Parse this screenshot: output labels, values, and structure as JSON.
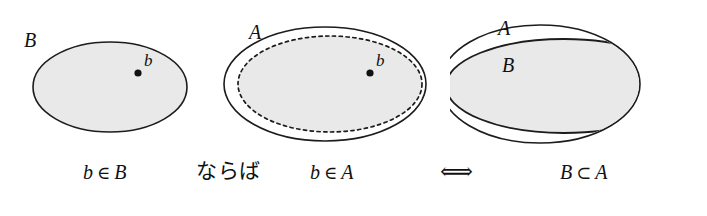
{
  "figure": {
    "background_color": "#ffffff",
    "stroke_color": "#1c1c1c",
    "fill_color": "#e9e9e9"
  },
  "panels": [
    {
      "id": "panel-1",
      "name": "set-b-with-element",
      "set_label": "B",
      "point_label": "b",
      "shapes": [
        {
          "name": "ellipse-b",
          "style": "solid",
          "filled": true
        }
      ],
      "caption": "b ∈ B",
      "caption_left": "b",
      "caption_op": "∈",
      "caption_right": "B"
    },
    {
      "id": "panel-2",
      "name": "set-a-containing-subset-with-element",
      "set_label": "A",
      "point_label": "b",
      "shapes": [
        {
          "name": "ellipse-a-outer",
          "style": "solid",
          "filled": false
        },
        {
          "name": "ellipse-b-inner-dashed",
          "style": "dashed",
          "filled": true
        }
      ],
      "caption": "b ∈ A",
      "caption_left": "b",
      "caption_op": "∈",
      "caption_right": "A"
    },
    {
      "id": "panel-3",
      "name": "set-b-subset-of-set-a",
      "set_label_outer": "A",
      "set_label_inner": "B",
      "shapes": [
        {
          "name": "ellipse-a-outer",
          "style": "solid",
          "filled": false
        },
        {
          "name": "ellipse-b-inner",
          "style": "solid",
          "filled": true
        }
      ],
      "caption": "B ⊂ A",
      "caption_left": "B",
      "caption_op": "⊂",
      "caption_right": "A"
    }
  ],
  "connectors": {
    "implication_text": "ならば",
    "equivalence_symbol": "⟺"
  }
}
